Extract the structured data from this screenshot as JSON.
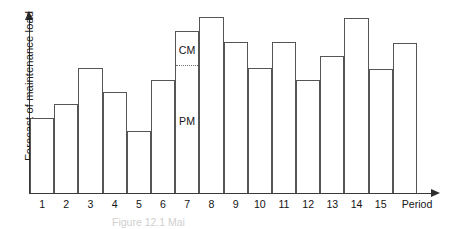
{
  "chart_data": {
    "type": "bar",
    "title": "",
    "xlabel": "Period",
    "ylabel": "Forecast of maintenance load",
    "categories": [
      "1",
      "2",
      "3",
      "4",
      "5",
      "6",
      "7",
      "8",
      "9",
      "10",
      "11",
      "12",
      "13",
      "14",
      "15",
      ""
    ],
    "values": [
      75,
      89,
      125,
      101,
      62,
      113,
      162,
      176,
      151,
      125,
      151,
      113,
      137,
      175,
      124,
      150
    ],
    "ylim": [
      0,
      180
    ],
    "grid": false,
    "legend": "none",
    "annotations": [
      {
        "label": "CM",
        "bar_index": 6,
        "segment": "upper"
      },
      {
        "label": "PM",
        "bar_index": 6,
        "segment": "lower"
      }
    ],
    "split_bar": {
      "bar_index": 6,
      "split_value": 127,
      "upper_label": "CM",
      "lower_label": "PM",
      "line_style": "dotted"
    }
  },
  "axes": {
    "y_label": "Forecast of maintenance load",
    "x_label": "Period",
    "y_arrow_icon": "arrow-up-icon",
    "x_arrow_icon": "arrow-right-icon"
  },
  "ticks": {
    "labels": [
      "1",
      "2",
      "3",
      "4",
      "5",
      "6",
      "7",
      "8",
      "9",
      "10",
      "11",
      "12",
      "13",
      "14",
      "15"
    ]
  },
  "caption": {
    "text": "Figure 12.1   Mai"
  }
}
